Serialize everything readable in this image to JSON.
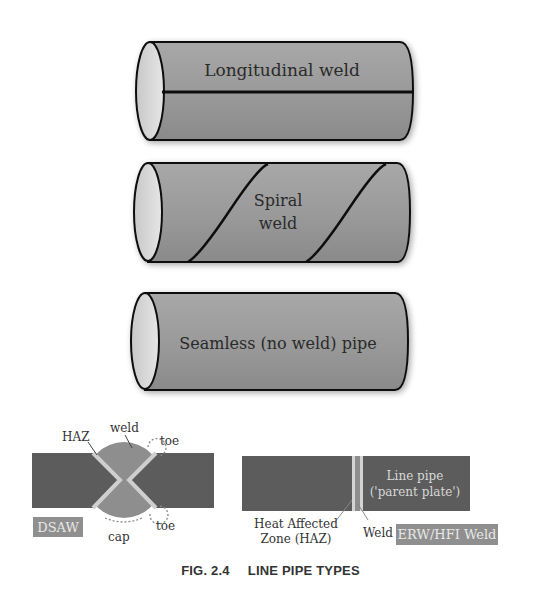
{
  "figure": {
    "caption_number": "FIG. 2.4",
    "caption_title": "LINE PIPE TYPES"
  },
  "pipes": [
    {
      "label": "Longitudinal weld"
    },
    {
      "label_line1": "Spiral",
      "label_line2": "weld"
    },
    {
      "label": "Seamless (no weld) pipe"
    }
  ],
  "dsaw": {
    "badge": "DSAW",
    "haz_label": "HAZ",
    "weld_label": "weld",
    "toe_top_label": "toe",
    "toe_bottom_label": "toe",
    "cap_label": "cap"
  },
  "erw": {
    "badge": "ERW/HFI Weld",
    "line_pipe_line1": "Line pipe",
    "line_pipe_line2": "('parent plate')",
    "haz_line1": "Heat Affected",
    "haz_line2": "Zone (HAZ)",
    "weld_label": "Weld"
  },
  "colors": {
    "pipe_body": "#9a9a9a",
    "pipe_end": "#d8d8d8",
    "plate": "#5c5c5c",
    "weld_metal": "#8e8e8e",
    "haz": "#cfcfcf",
    "badge": "#8f8f8f"
  }
}
